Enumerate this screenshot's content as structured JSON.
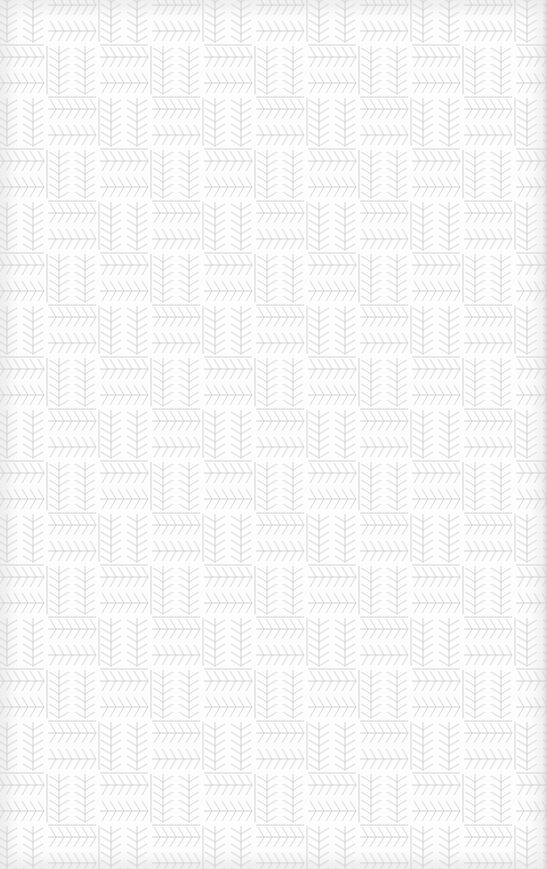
{
  "texture": {
    "name": "herringbone basketweave",
    "background_color": "#fdfdfd",
    "line_color": "#c9c9c9",
    "chevron_color": "#e2e2e2",
    "block_size_px": 52,
    "repeat_px": 104
  }
}
